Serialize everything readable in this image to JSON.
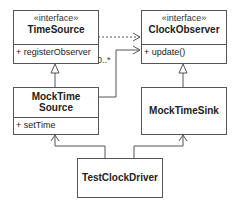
{
  "classes": {
    "time_source": {
      "stereotype": "«interface»",
      "name": "TimeSource",
      "members": [
        "+ registerObserver"
      ]
    },
    "clock_observer": {
      "stereotype": "«interface»",
      "name": "ClockObserver",
      "members": [
        "+ update()"
      ]
    },
    "mock_time_source": {
      "name_line1": "MockTime",
      "name_line2": "Source",
      "members": [
        "+ setTime"
      ]
    },
    "mock_time_sink": {
      "name": "MockTimeSink"
    },
    "test_clock_driver": {
      "name": "TestClockDriver"
    }
  },
  "relations": {
    "multiplicity": "0..*"
  }
}
